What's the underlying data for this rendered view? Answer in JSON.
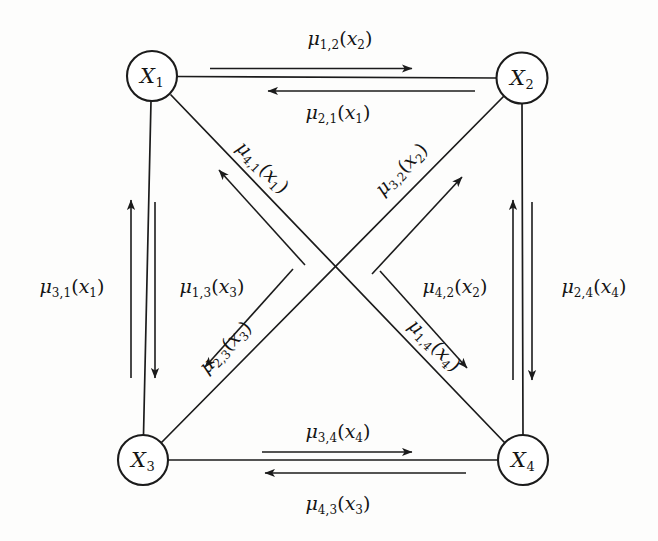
{
  "figure": {
    "type": "message-passing-graph",
    "background_color": "#fdfdfc",
    "ink_color": "#1b1b1b",
    "node_radius": 25
  },
  "nodes": [
    {
      "id": "x1",
      "label_base": "X",
      "label_sub": "1",
      "cx": 152,
      "cy": 76
    },
    {
      "id": "x2",
      "label_base": "X",
      "label_sub": "2",
      "cx": 522,
      "cy": 78
    },
    {
      "id": "x3",
      "label_base": "X",
      "label_sub": "3",
      "cx": 143,
      "cy": 460
    },
    {
      "id": "x4",
      "label_base": "X",
      "label_sub": "4",
      "cx": 523,
      "cy": 460
    }
  ],
  "messages": [
    {
      "id": "mu-1-2",
      "text": "μ1,2(x2)",
      "mu": "μ",
      "sub": "1,2",
      "arg_open": "(",
      "arg_var": "x",
      "arg_sub": "2",
      "arg_close": ")",
      "from": "x1",
      "to": "x2",
      "edge": "top",
      "direction": "right",
      "x": 340,
      "y": 40,
      "rotation": 0
    },
    {
      "id": "mu-2-1",
      "text": "μ2,1(x1)",
      "mu": "μ",
      "sub": "2,1",
      "arg_open": "(",
      "arg_var": "x",
      "arg_sub": "1",
      "arg_close": ")",
      "from": "x2",
      "to": "x1",
      "edge": "top",
      "direction": "left",
      "x": 338,
      "y": 114,
      "rotation": 0
    },
    {
      "id": "mu-3-1",
      "text": "μ3,1(x1)",
      "mu": "μ",
      "sub": "3,1",
      "arg_open": "(",
      "arg_var": "x",
      "arg_sub": "1",
      "arg_close": ")",
      "from": "x3",
      "to": "x1",
      "edge": "left",
      "direction": "up",
      "x": 72,
      "y": 288,
      "rotation": 0
    },
    {
      "id": "mu-1-3",
      "text": "μ1,3(x3)",
      "mu": "μ",
      "sub": "1,3",
      "arg_open": "(",
      "arg_var": "x",
      "arg_sub": "3",
      "arg_close": ")",
      "from": "x1",
      "to": "x3",
      "edge": "left",
      "direction": "down",
      "x": 212,
      "y": 288,
      "rotation": 0
    },
    {
      "id": "mu-4-2",
      "text": "μ4,2(x2)",
      "mu": "μ",
      "sub": "4,2",
      "arg_open": "(",
      "arg_var": "x",
      "arg_sub": "2",
      "arg_close": ")",
      "from": "x4",
      "to": "x2",
      "edge": "right",
      "direction": "up",
      "x": 455,
      "y": 288,
      "rotation": 0
    },
    {
      "id": "mu-2-4",
      "text": "μ2,4(x4)",
      "mu": "μ",
      "sub": "2,4",
      "arg_open": "(",
      "arg_var": "x",
      "arg_sub": "4",
      "arg_close": ")",
      "from": "x2",
      "to": "x4",
      "edge": "right",
      "direction": "down",
      "x": 594,
      "y": 288,
      "rotation": 0
    },
    {
      "id": "mu-3-4",
      "text": "μ3,4(x4)",
      "mu": "μ",
      "sub": "3,4",
      "arg_open": "(",
      "arg_var": "x",
      "arg_sub": "4",
      "arg_close": ")",
      "from": "x3",
      "to": "x4",
      "edge": "bottom",
      "direction": "right",
      "x": 338,
      "y": 433,
      "rotation": 0
    },
    {
      "id": "mu-4-3",
      "text": "μ4,3(x3)",
      "mu": "μ",
      "sub": "4,3",
      "arg_open": "(",
      "arg_var": "x",
      "arg_sub": "3",
      "arg_close": ")",
      "from": "x4",
      "to": "x3",
      "edge": "bottom",
      "direction": "left",
      "x": 338,
      "y": 505,
      "rotation": 0
    },
    {
      "id": "mu-4-1",
      "text": "μ4,1(x1)",
      "mu": "μ",
      "sub": "4,1",
      "arg_open": "(",
      "arg_var": "x",
      "arg_sub": "1",
      "arg_close": ")",
      "from": "x4",
      "to": "x1",
      "edge": "diagonal-x1-x4",
      "direction": "up-left",
      "x": 262,
      "y": 168,
      "rotation": 45
    },
    {
      "id": "mu-1-4",
      "text": "μ1,4(x4)",
      "mu": "μ",
      "sub": "1,4",
      "arg_open": "(",
      "arg_var": "x",
      "arg_sub": "4",
      "arg_close": ")",
      "from": "x1",
      "to": "x4",
      "edge": "diagonal-x1-x4",
      "direction": "down-right",
      "x": 434,
      "y": 346,
      "rotation": 45
    },
    {
      "id": "mu-3-2",
      "text": "μ3,2(x2)",
      "mu": "μ",
      "sub": "3,2",
      "arg_open": "(",
      "arg_var": "x",
      "arg_sub": "2",
      "arg_close": ")",
      "from": "x3",
      "to": "x2",
      "edge": "diagonal-x2-x3",
      "direction": "up-right",
      "x": 402,
      "y": 170,
      "rotation": -45
    },
    {
      "id": "mu-2-3",
      "text": "μ2,3(x3)",
      "mu": "μ",
      "sub": "2,3",
      "arg_open": "(",
      "arg_var": "x",
      "arg_sub": "3",
      "arg_close": ")",
      "from": "x2",
      "to": "x3",
      "edge": "diagonal-x2-x3",
      "direction": "down-left",
      "x": 226,
      "y": 348,
      "rotation": -45
    }
  ]
}
